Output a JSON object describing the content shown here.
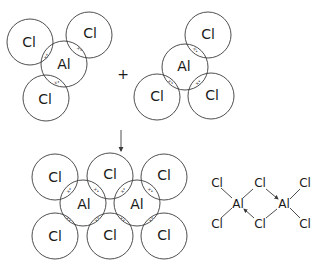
{
  "diagram": {
    "colors": {
      "line": "#3a3a3a",
      "text": "#1a1a1a"
    },
    "reactant_1": {
      "label": "AlCl3",
      "central_atom": "Al",
      "outer_atoms": [
        "Cl",
        "Cl",
        "Cl"
      ],
      "shared_pair_mark": "x•"
    },
    "operator": "+",
    "reactant_2": {
      "label": "AlCl3",
      "central_atom": "Al",
      "outer_atoms": [
        "Cl",
        "Cl",
        "Cl"
      ],
      "shared_pair_mark": "x•"
    },
    "reaction_arrow": "↓",
    "product": {
      "label": "Al2Cl6",
      "top_row": [
        "Cl",
        "Cl",
        "Cl"
      ],
      "middle_row": [
        "Al",
        "Al"
      ],
      "bottom_row": [
        "Cl",
        "Cl",
        "Cl"
      ],
      "shared_pair_mark": "x•"
    },
    "structural_formula": {
      "atoms": {
        "al_left": "Al",
        "al_right": "Al",
        "cl_top_left": "Cl",
        "cl_bottom_left": "Cl",
        "cl_bridge_top": "Cl",
        "cl_bridge_bottom": "Cl",
        "cl_top_right": "Cl",
        "cl_bottom_right": "Cl"
      },
      "dative_bonds": [
        "Cl(bridge top) → Al(right)",
        "Cl(bridge bottom) → Al(left)"
      ]
    }
  }
}
